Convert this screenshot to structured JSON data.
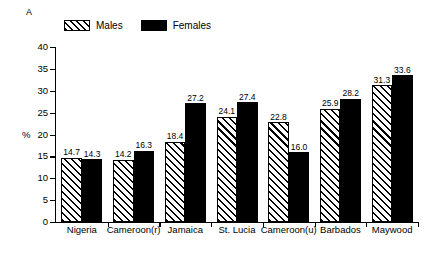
{
  "panel": {
    "label": "A"
  },
  "legend": {
    "entries": [
      {
        "label": "Males",
        "swatch": "hatched-diagonal"
      },
      {
        "label": "Females",
        "swatch": "solid-black"
      }
    ]
  },
  "axes": {
    "y_title": "%",
    "y_ticks": [
      "0",
      "5",
      "10",
      "15",
      "20",
      "25",
      "30",
      "35",
      "40"
    ]
  },
  "chart_data": {
    "type": "bar",
    "title": "A",
    "xlabel": "",
    "ylabel": "%",
    "ylim": [
      0,
      40
    ],
    "ytick_values": [
      0,
      5,
      10,
      15,
      20,
      25,
      30,
      35,
      40
    ],
    "grid": false,
    "legend_position": "top-left",
    "categories": [
      "Nigeria",
      "Cameroon(r)",
      "Jamaica",
      "St. Lucia",
      "Cameroon(u)",
      "Barbados",
      "Maywood"
    ],
    "series": [
      {
        "name": "Males",
        "values": [
          14.7,
          14.2,
          18.4,
          24.1,
          22.8,
          25.9,
          31.3
        ],
        "labels": [
          "14.7",
          "14.2",
          "18.4",
          "24.1",
          "22.8",
          "25.9",
          "31.3"
        ]
      },
      {
        "name": "Females",
        "values": [
          14.3,
          16.3,
          27.2,
          27.4,
          16.0,
          28.2,
          33.6
        ],
        "labels": [
          "14.3",
          "16.3",
          "27.2",
          "27.4",
          "16.0",
          "28.2",
          "33.6"
        ]
      }
    ]
  }
}
